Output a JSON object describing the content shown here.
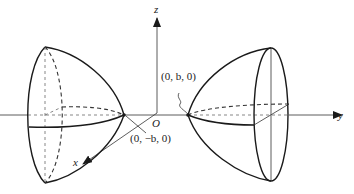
{
  "figure": {
    "axes": {
      "x_label": "x",
      "y_label": "y",
      "z_label": "z",
      "origin_label": "O"
    },
    "points": {
      "positive_vertex": "(0, b, 0)",
      "negative_vertex": "(0, −b, 0)"
    },
    "colors": {
      "line": "#1a1a1a",
      "background": "#ffffff"
    }
  }
}
